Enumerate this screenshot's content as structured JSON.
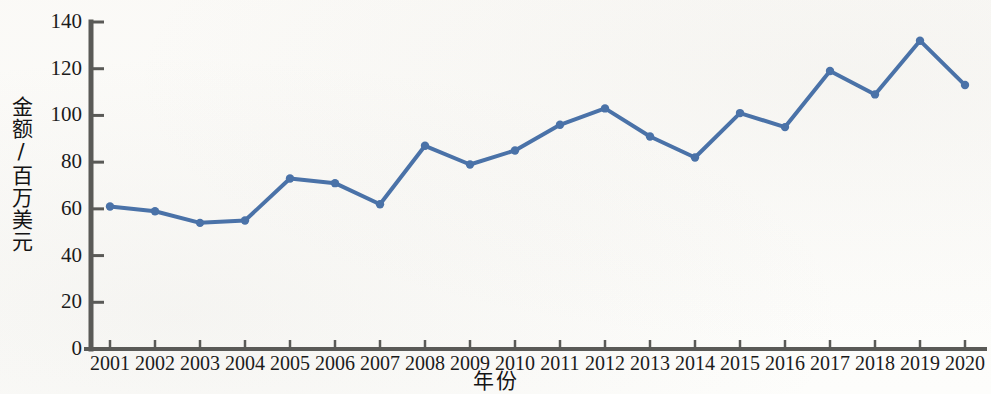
{
  "chart_data": {
    "type": "line",
    "title": "",
    "xlabel": "年份",
    "ylabel": "金额/百万美元",
    "categories": [
      "2001",
      "2002",
      "2003",
      "2004",
      "2005",
      "2006",
      "2007",
      "2008",
      "2009",
      "2010",
      "2011",
      "2012",
      "2013",
      "2014",
      "2015",
      "2016",
      "2017",
      "2018",
      "2019",
      "2020"
    ],
    "values": [
      61,
      59,
      54,
      55,
      73,
      71,
      62,
      87,
      79,
      85,
      96,
      103,
      91,
      82,
      101,
      95,
      119,
      109,
      132,
      113
    ],
    "ylim": [
      0,
      140
    ],
    "ytick_labels": [
      "0",
      "20",
      "40",
      "60",
      "80",
      "100",
      "120",
      "140"
    ],
    "ytick_values": [
      0,
      20,
      40,
      60,
      80,
      100,
      120,
      140
    ],
    "grid": false,
    "legend": false,
    "legend_position": "none",
    "series_color": "#4a72a8",
    "axis_color": "#5a5a57",
    "marker": "circle",
    "line_width": 4
  }
}
